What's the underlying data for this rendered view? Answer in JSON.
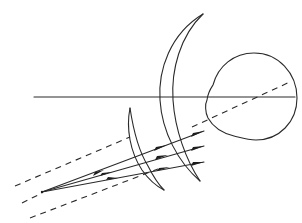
{
  "diagram": {
    "title": "Optical ray diagram: lenses focusing onto eye",
    "colors": {
      "line": "#2a2a2a",
      "background": "#ffffff"
    },
    "elements": {
      "optical_axis": {
        "label": "optical-axis",
        "x1": 34,
        "y1": 97,
        "x2": 295,
        "y2": 97
      },
      "large_lens": {
        "label": "large-meniscus-lens",
        "top": [
          203,
          14
        ],
        "bottom": [
          200,
          181
        ]
      },
      "small_lens": {
        "label": "small-meniscus-lens",
        "top": [
          130,
          108
        ],
        "bottom": [
          164,
          190
        ]
      },
      "eye": {
        "label": "eyeball",
        "cx": 252,
        "cy": 98,
        "r": 45
      },
      "focal_point": {
        "label": "focal-point",
        "x": 42,
        "y": 192
      },
      "rays": [
        {
          "label": "ray-upper",
          "to": [
            204,
            131
          ]
        },
        {
          "label": "ray-middle",
          "to": [
            204,
            146
          ]
        },
        {
          "label": "ray-lower",
          "to": [
            204,
            162
          ]
        }
      ],
      "dashed_lines": [
        {
          "label": "dashed-upper",
          "from": [
            15,
            185
          ],
          "to": [
            128,
            137
          ]
        },
        {
          "label": "dashed-eye-axis",
          "from": [
            192,
            126
          ],
          "to": [
            292,
            80
          ]
        },
        {
          "label": "dashed-lower",
          "from": [
            30,
            218
          ],
          "to": [
            160,
            168
          ]
        }
      ]
    }
  }
}
